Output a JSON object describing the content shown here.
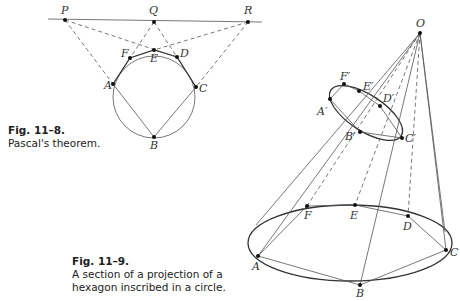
{
  "figure_8": {
    "label": "Fig. 11–8.",
    "caption": "Pascal's theorem.",
    "point_labels": {
      "P": "P",
      "Q": "Q",
      "R": "R",
      "A": "A",
      "B": "B",
      "C": "C",
      "D": "D",
      "E": "E",
      "F": "F"
    }
  },
  "figure_9": {
    "label": "Fig. 11–9.",
    "caption_line1": "A section of a projection of a",
    "caption_line2": "hexagon inscribed in a circle.",
    "point_labels": {
      "O": "O",
      "A": "A",
      "B": "B",
      "C": "C",
      "D": "D",
      "E": "E",
      "F": "F",
      "A1": "A′",
      "B1": "B′",
      "C1": "C′",
      "D1": "D′",
      "E1": "E′",
      "F1": "F′"
    }
  }
}
